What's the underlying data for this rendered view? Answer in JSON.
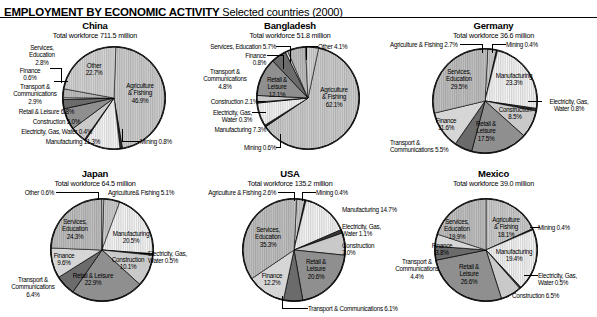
{
  "header": {
    "title_bold": "EMPLOYMENT BY ECONOMIC ACTIVITY",
    "title_rest": " Selected countries (2000)"
  },
  "chart_data": [
    {
      "type": "pie",
      "title": "China",
      "subtitle": "Total workforce 711.5 million",
      "unit": "%",
      "categories": [
        "Agriculture & Fishing",
        "Mining",
        "Manufacturing",
        "Electricity, Gas, Water",
        "Construction",
        "Retail & Leisure",
        "Transport & Communications",
        "Finance",
        "Services, Education",
        "Other"
      ],
      "values": [
        46.9,
        0.8,
        11.3,
        0.4,
        5.0,
        6.8,
        2.9,
        0.6,
        2.8,
        22.7
      ],
      "labels": [
        "Agriculture & Fishing 46.9%",
        "Mining 0.8%",
        "Manufacturing 11.3%",
        "Electricity, Gas, Water 0.4%",
        "Construction 5.0%",
        "Retail & Leisure 6.8%",
        "Transport & Communications 2.9%",
        "Finance 0.6%",
        "Services, Education 2.8%",
        "Other 22.7%"
      ]
    },
    {
      "type": "pie",
      "title": "Bangladesh",
      "subtitle": "Total workforce 51.8 million",
      "unit": "%",
      "categories": [
        "Agriculture & Fishing",
        "Mining",
        "Manufacturing",
        "Electricity, Gas, Water",
        "Construction",
        "Retail & Leisure",
        "Transport & Communications",
        "Finance",
        "Services, Education",
        "Other"
      ],
      "values": [
        62.1,
        0.6,
        7.3,
        0.3,
        2.1,
        12.1,
        4.8,
        0.8,
        5.7,
        4.1
      ],
      "labels": [
        "Agriculture & Fishing 62.1%",
        "Mining 0.6%",
        "Manufacturing 7.3%",
        "Electricity, Gas, Water 0.3%",
        "Construction 2.1%",
        "Retail & Leisure 12.1%",
        "Transport & Communications 4.8%",
        "Finance 0.8%",
        "Services, Education 5.7%",
        "Other 4.1%"
      ]
    },
    {
      "type": "pie",
      "title": "Germany",
      "subtitle": "Total workforce 36.6 million",
      "unit": "%",
      "categories": [
        "Agriculture & Fishing",
        "Mining",
        "Manufacturing",
        "Electricity, Gas, Water",
        "Construction",
        "Retail & Leisure",
        "Transport & Communications",
        "Finance",
        "Services, Education"
      ],
      "values": [
        2.7,
        0.4,
        23.3,
        0.8,
        8.5,
        17.5,
        5.5,
        11.6,
        29.5
      ],
      "labels": [
        "Agriculture & Fishing 2.7%",
        "Mining 0.4%",
        "Manufacturing 23.3%",
        "Electricity, Gas, Water 0.8%",
        "Construction 8.5%",
        "Retail & Leisure 17.5%",
        "Transport & Communications 5.5%",
        "Finance 11.6%",
        "Services, Education 29.5%"
      ]
    },
    {
      "type": "pie",
      "title": "Japan",
      "subtitle": "Total workforce 64.5 million",
      "unit": "%",
      "categories": [
        "Agriculture & Fishing",
        "Manufacturing",
        "Electricity, Gas, Water",
        "Construction",
        "Retail & Leisure",
        "Transport & Communications",
        "Finance",
        "Services, Education",
        "Other"
      ],
      "values": [
        5.1,
        20.5,
        0.5,
        10.1,
        22.9,
        6.4,
        9.6,
        24.3,
        0.6
      ],
      "labels": [
        "Agriculture & Fishing 5.1%",
        "Manufacturing 20.5%",
        "Electricity, Gas, Water 0.5%",
        "Construction 10.1%",
        "Retail & Leisure 22.9%",
        "Transport & Communications 6.4%",
        "Finance 9.6%",
        "Services, Education 24.3%",
        "Other 0.6%"
      ]
    },
    {
      "type": "pie",
      "title": "USA",
      "subtitle": "Total workforce 135.2 million",
      "unit": "%",
      "categories": [
        "Agriculture & Fishing",
        "Mining",
        "Manufacturing",
        "Electricity, Gas, Water",
        "Construction",
        "Retail & Leisure",
        "Transport & Communications",
        "Finance",
        "Services, Education"
      ],
      "values": [
        2.6,
        0.4,
        14.7,
        1.1,
        7.0,
        20.6,
        6.1,
        12.2,
        35.3
      ],
      "labels": [
        "Agriculture & Fishing 2.6%",
        "Mining 0.4%",
        "Manufacturing 14.7%",
        "Electricity, Gas, Water 1.1%",
        "Construction 7.0%",
        "Retail & Leisure 20.6%",
        "Transport & Communications 6.1%",
        "Finance 12.2%",
        "Services, Education 35.3%"
      ]
    },
    {
      "type": "pie",
      "title": "Mexico",
      "subtitle": "Total workforce 39.0 million",
      "unit": "%",
      "categories": [
        "Agriculture & Fishing",
        "Mining",
        "Manufacturing",
        "Electricity, Gas, Water",
        "Construction",
        "Retail & Leisure",
        "Transport & Communications",
        "Finance",
        "Services, Education"
      ],
      "values": [
        18.1,
        0.4,
        19.4,
        0.5,
        6.5,
        26.6,
        4.4,
        3.8,
        19.9
      ],
      "labels": [
        "Agriculture & Fishing 18.1%",
        "Mining 0.4%",
        "Manufacturing 19.4%",
        "Electricity, Gas, Water 0.5%",
        "Construction 6.5%",
        "Retail & Leisure 26.6%",
        "Transport & Communications 4.4%",
        "Finance 3.8%",
        "Services, Education 19.9%"
      ]
    }
  ],
  "china": {
    "title": "China",
    "subtitle": "Total workforce 711.5 million",
    "in_agri": "Agriculture\n& Fishing\n46.9%",
    "in_agri_l1": "Agriculture",
    "in_agri_l2": "& Fishing",
    "in_agri_l3": "46.9%",
    "in_other_l1": "Other",
    "in_other_l2": "22.7%",
    "svc_l1": "Services,",
    "svc_l2": "Education",
    "svc_l3": "2.8%",
    "fin_l1": "Finance",
    "fin_l2": "0.6%",
    "tra_l1": "Transport &",
    "tra_l2": "Communications",
    "tra_l3": "2.9%",
    "retail": "Retail & Leisure 6.8%",
    "constr": "Construction 5.0%",
    "elec": "Electricity, Gas, Water 0.4%",
    "manu": "Manufacturing 11.3%",
    "mining": "Mining 0.8%"
  },
  "bangladesh": {
    "title": "Bangladesh",
    "subtitle": "Total workforce 51.8 million",
    "in_agri_l1": "Agriculture",
    "in_agri_l2": "& Fishing",
    "in_agri_l3": "62.1%",
    "in_retail_l1": "Retail &",
    "in_retail_l2": "Leisure",
    "in_retail_l3": "12.1%",
    "svc": "Services, Education 5.7%",
    "other": "Other 4.1%",
    "fin_l1": "Finance",
    "fin_l2": "0.8%",
    "tra_l1": "Transport &",
    "tra_l2": "Communications",
    "tra_l3": "4.8%",
    "constr": "Construction 2.1%",
    "elec_l1": "Electricity, Gas,",
    "elec_l2": "Water 0.3%",
    "manu": "Manufacturing 7.3%",
    "mining": "Mining 0.6%"
  },
  "germany": {
    "title": "Germany",
    "subtitle": "Total workforce 36.6 million",
    "agri": "Agriculture & Fishing 2.7%",
    "mining": "Mining 0.4%",
    "in_svc_l1": "Services,",
    "in_svc_l2": "Education",
    "in_svc_l3": "29.5%",
    "in_manu_l1": "Manufacturing",
    "in_manu_l2": "23.3%",
    "in_constr_l1": "Construction",
    "in_constr_l2": "8.5%",
    "in_retail_l1": "Retail &",
    "in_retail_l2": "Leisure",
    "in_retail_l3": "17.5%",
    "in_fin_l1": "Finance",
    "in_fin_l2": "11.6%",
    "elec_l1": "Electricity, Gas,",
    "elec_l2": "Water 0.8%",
    "tra_l1": "Transport &",
    "tra_l2": "Communications 5.5%"
  },
  "japan": {
    "title": "Japan",
    "subtitle": "Total workforce 64.5 million",
    "other": "Other 0.6%",
    "agri": "Agriculture& Fishing 5.1%",
    "in_svc_l1": "Services,",
    "in_svc_l2": "Education",
    "in_svc_l3": "24.3%",
    "in_manu_l1": "Manufacturing",
    "in_manu_l2": "20.5%",
    "in_constr_l1": "Construction",
    "in_constr_l2": "10.1%",
    "in_retail_l1": "Retail & Leisure",
    "in_retail_l2": "22.9%",
    "in_fin_l1": "Finance",
    "in_fin_l2": "9.6%",
    "elec_l1": "Electricity, Gas,",
    "elec_l2": "Water 0.5%",
    "tra_l1": "Transport &",
    "tra_l2": "Communications",
    "tra_l3": "6.4%"
  },
  "usa": {
    "title": "USA",
    "subtitle": "Total workforce 135.2 million",
    "agri": "Agriculture & Fishing 2.6%",
    "mining": "Mining 0.4%",
    "manu": "Manufacturing 14.7%",
    "elec_l1": "Electricity, Gas,",
    "elec_l2": "Water 1.1%",
    "constr_l1": "Construction",
    "constr_l2": "7.0%",
    "in_svc_l1": "Services,",
    "in_svc_l2": "Education",
    "in_svc_l3": "35.3%",
    "in_retail_l1": "Retail &",
    "in_retail_l2": "Leisure",
    "in_retail_l3": "20.6%",
    "in_fin_l1": "Finance",
    "in_fin_l2": "12.2%",
    "tra": "Transport & Communications 6.1%"
  },
  "mexico": {
    "title": "Mexico",
    "subtitle": "Total workforce 39.0 million",
    "in_svc_l1": "Services,",
    "in_svc_l2": "Education",
    "in_svc_l3": "19.9%",
    "in_agri_l1": "Agriculture",
    "in_agri_l2": "& Fishing",
    "in_agri_l3": "18.1%",
    "in_manu_l1": "Manufacturing",
    "in_manu_l2": "19.4%",
    "in_retail_l1": "Retail &",
    "in_retail_l2": "Leisure",
    "in_retail_l3": "26.6%",
    "in_fin_l1": "Finance",
    "in_fin_l2": "3.8%",
    "mining": "Mining 0.4%",
    "elec_l1": "Electricity, Gas,",
    "elec_l2": "Water 0.5%",
    "constr": "Construction 6.5%",
    "tra_l1": "Transport &",
    "tra_l2": "Communications",
    "tra_l3": "4.4%"
  }
}
